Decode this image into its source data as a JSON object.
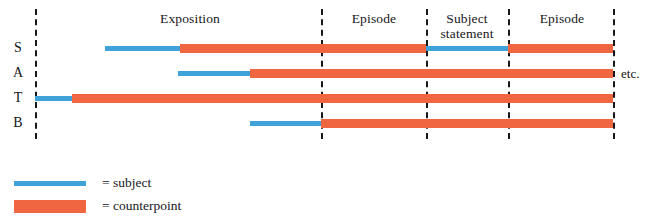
{
  "figure": {
    "kind": "fugue-structure-diagram",
    "background_color": "#ffffff",
    "width": 649,
    "height": 224
  },
  "colors": {
    "subject": "#3FA2D8",
    "counterpoint": "#F06641",
    "divider": "#18181a",
    "text": "#16161a"
  },
  "voices": [
    {
      "id": "S",
      "label": "S",
      "name": "soprano"
    },
    {
      "id": "A",
      "label": "A",
      "name": "alto"
    },
    {
      "id": "T",
      "label": "T",
      "name": "tenor"
    },
    {
      "id": "B",
      "label": "B",
      "name": "bass"
    }
  ],
  "sections": [
    {
      "id": "exposition",
      "label": "Exposition"
    },
    {
      "id": "episode-1",
      "label": "Episode"
    },
    {
      "id": "subject-statement",
      "label": "Subject\nstatement"
    },
    {
      "id": "episode-2",
      "label": "Episode"
    }
  ],
  "dividers": [
    {
      "id": "divider-1",
      "x": 35
    },
    {
      "id": "divider-2",
      "x": 321
    },
    {
      "id": "divider-3",
      "x": 426
    },
    {
      "id": "divider-4",
      "x": 508
    },
    {
      "id": "divider-5",
      "x": 613
    }
  ],
  "trailing": {
    "label": "etc."
  },
  "legend": {
    "items": [
      {
        "id": "legend-subject",
        "type": "subject",
        "label": "= subject"
      },
      {
        "id": "legend-counterpoint",
        "type": "counterpoint",
        "label": "= counterpoint"
      }
    ]
  },
  "chart_data": {
    "type": "timeline",
    "title": "",
    "xlabel": "",
    "ylabel": "",
    "x_axis_units": "pixels-of-musical-time",
    "grid": false,
    "legend_position": "bottom-left",
    "categories": [
      "S",
      "A",
      "T",
      "B"
    ],
    "series": [
      {
        "name": "subject",
        "color": "#3FA2D8"
      },
      {
        "name": "counterpoint",
        "color": "#F06641"
      }
    ],
    "rows": [
      {
        "voice": "S",
        "segments": [
          {
            "type": "subject",
            "start": 105,
            "end": 180
          },
          {
            "type": "counterpoint",
            "start": 180,
            "end": 426
          },
          {
            "type": "subject",
            "start": 426,
            "end": 508
          },
          {
            "type": "counterpoint",
            "start": 508,
            "end": 613
          }
        ]
      },
      {
        "voice": "A",
        "segments": [
          {
            "type": "subject",
            "start": 178,
            "end": 250
          },
          {
            "type": "counterpoint",
            "start": 250,
            "end": 613
          }
        ]
      },
      {
        "voice": "T",
        "segments": [
          {
            "type": "subject",
            "start": 35,
            "end": 72
          },
          {
            "type": "counterpoint",
            "start": 72,
            "end": 613
          }
        ]
      },
      {
        "voice": "B",
        "segments": [
          {
            "type": "subject",
            "start": 250,
            "end": 321
          },
          {
            "type": "counterpoint",
            "start": 321,
            "end": 613
          }
        ]
      }
    ],
    "annotations": [
      {
        "text": "Exposition",
        "x": 190,
        "y": 18
      },
      {
        "text": "Episode",
        "x": 374,
        "y": 18
      },
      {
        "text": "Subject statement",
        "x": 467,
        "y": 18
      },
      {
        "text": "Episode",
        "x": 561,
        "y": 18
      },
      {
        "text": "etc.",
        "x": 625,
        "y": 73
      }
    ]
  }
}
